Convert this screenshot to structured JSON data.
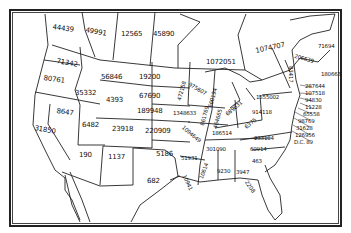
{
  "map": {
    "type": "outline map of the United States with per-state numeric values",
    "labels": [
      {
        "region": "British Columbia",
        "value": "44439"
      },
      {
        "region": "Alberta",
        "value": "49991"
      },
      {
        "region": "Saskatchewan",
        "value": "12565"
      },
      {
        "region": "Manitoba",
        "value": "45890"
      },
      {
        "region": "Ontario",
        "value": "1072051"
      },
      {
        "region": "Quebec",
        "value": "1074707"
      },
      {
        "region": "New Brunswick",
        "value": "71694"
      },
      {
        "region": "Maine",
        "value": "206639"
      },
      {
        "region": "Nova Scotia",
        "value": "180663"
      },
      {
        "region": "Vermont",
        "value": "83417"
      },
      {
        "region": "New Hampshire",
        "value": "287644"
      },
      {
        "region": "Massachusetts",
        "value": "107518"
      },
      {
        "region": "Rhode Island",
        "value": "94830"
      },
      {
        "region": "Connecticut",
        "value": "11228"
      },
      {
        "region": "New Jersey",
        "value": "65558"
      },
      {
        "region": "Delaware",
        "value": "98769"
      },
      {
        "region": "Maryland",
        "value": "31628"
      },
      {
        "region": "Virginia area",
        "value": "126956"
      },
      {
        "region": "District of Columbia",
        "value": "D.C. 89"
      },
      {
        "region": "New York",
        "value": "1555002"
      },
      {
        "region": "Pennsylvania",
        "value": "914118"
      },
      {
        "region": "Washington",
        "value": "71342"
      },
      {
        "region": "Oregon",
        "value": "80761"
      },
      {
        "region": "Idaho",
        "value": "35332"
      },
      {
        "region": "Montana",
        "value": "56846"
      },
      {
        "region": "Wyoming",
        "value": "4393"
      },
      {
        "region": "Nevada",
        "value": "8647"
      },
      {
        "region": "California",
        "value": "31850"
      },
      {
        "region": "Utah",
        "value": "6482"
      },
      {
        "region": "Colorado",
        "value": "23918"
      },
      {
        "region": "Arizona",
        "value": "190"
      },
      {
        "region": "New Mexico",
        "value": "1137"
      },
      {
        "region": "North Dakota",
        "value": "19200"
      },
      {
        "region": "South Dakota",
        "value": "67690"
      },
      {
        "region": "Nebraska",
        "value": "189948"
      },
      {
        "region": "Kansas",
        "value": "220909"
      },
      {
        "region": "Oklahoma",
        "value": "5186"
      },
      {
        "region": "Texas",
        "value": "682"
      },
      {
        "region": "Minnesota",
        "value": "472158"
      },
      {
        "region": "Wisconsin",
        "value": "975607"
      },
      {
        "region": "Michigan",
        "value": "660194"
      },
      {
        "region": "Iowa",
        "value": "1348633"
      },
      {
        "region": "Missouri",
        "value": "1094649"
      },
      {
        "region": "Illinois",
        "value": "861769"
      },
      {
        "region": "Indiana",
        "value": "464665"
      },
      {
        "region": "Ohio",
        "value": "689631"
      },
      {
        "region": "Kentucky",
        "value": "186514"
      },
      {
        "region": "West Virginia",
        "value": "6375"
      },
      {
        "region": "Virginia",
        "value": "233104"
      },
      {
        "region": "Tennessee",
        "value": "301090"
      },
      {
        "region": "North Carolina",
        "value": "60914"
      },
      {
        "region": "South Carolina",
        "value": "463"
      },
      {
        "region": "Georgia",
        "value": "3947"
      },
      {
        "region": "Alabama",
        "value": "9230"
      },
      {
        "region": "Mississippi",
        "value": "10614"
      },
      {
        "region": "Arkansas",
        "value": "51931"
      },
      {
        "region": "Louisiana",
        "value": "10941"
      },
      {
        "region": "Florida",
        "value": "2208"
      }
    ]
  }
}
